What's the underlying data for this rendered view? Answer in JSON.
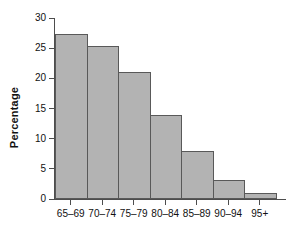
{
  "chart_data": {
    "type": "bar",
    "title": "",
    "xlabel": "",
    "ylabel": "Percentage",
    "categories": [
      "65–69",
      "70–74",
      "75–79",
      "80–84",
      "85–89",
      "90–94",
      "95+"
    ],
    "values": [
      27.3,
      25.3,
      21.1,
      14.0,
      7.9,
      3.1,
      1.0
    ],
    "ylim": [
      0,
      30
    ],
    "yticks": [
      0,
      5,
      10,
      15,
      20,
      25,
      30
    ],
    "ytick_labels": [
      "0",
      "5",
      "10",
      "15",
      "20",
      "25",
      "30"
    ],
    "grid": false,
    "legend": false,
    "legend_position": "none",
    "bar_fill_color": "#b3b3b3",
    "bar_border_color": "#595959",
    "axis_color": "#4d4d4d",
    "background_color": "#ffffff",
    "bars_contiguous": true
  },
  "axes": {
    "y_title": "Percentage"
  }
}
